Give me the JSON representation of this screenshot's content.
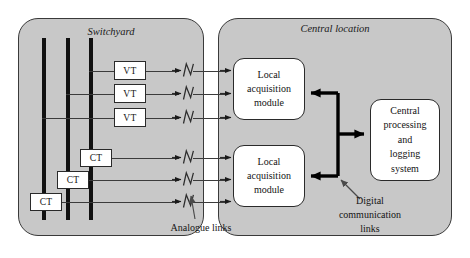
{
  "figure": {
    "kind": "substation-architecture-block-diagram",
    "colors": {
      "panel_fill": "#c8c8c8",
      "panel_stroke": "#3a3a3a",
      "box_fill": "#ffffff",
      "box_stroke": "#2a2a2a",
      "busbar": "#111111",
      "analogue_wire": "#3b3b3b",
      "digital_link": "#000000",
      "background": "#ffffff"
    }
  },
  "panels": {
    "switchyard": {
      "title": "Switchyard"
    },
    "central": {
      "title": "Central location"
    }
  },
  "switchyard": {
    "busbars": [
      {
        "name": "busbar-1"
      },
      {
        "name": "busbar-2"
      },
      {
        "name": "busbar-3"
      }
    ],
    "voltage_transformers": [
      {
        "label": "VT"
      },
      {
        "label": "VT"
      },
      {
        "label": "VT"
      }
    ],
    "current_transformers": [
      {
        "label": "CT"
      },
      {
        "label": "CT"
      },
      {
        "label": "CT"
      }
    ]
  },
  "central": {
    "modules": [
      {
        "lines": [
          "Local",
          "acquisition",
          "module"
        ]
      },
      {
        "lines": [
          "Local",
          "acquisition",
          "module"
        ]
      }
    ],
    "processor": {
      "lines": [
        "Central",
        "processing",
        "and",
        "logging",
        "system"
      ]
    }
  },
  "callouts": {
    "analogue": {
      "lines": [
        "Analogue links"
      ]
    },
    "digital": {
      "lines": [
        "Digital",
        "communication",
        "links"
      ]
    }
  },
  "links": {
    "analogue_count": 6,
    "analogue_break_symbol": "zigzag-slash",
    "digital_bus_label": "digital-communication-bus"
  }
}
